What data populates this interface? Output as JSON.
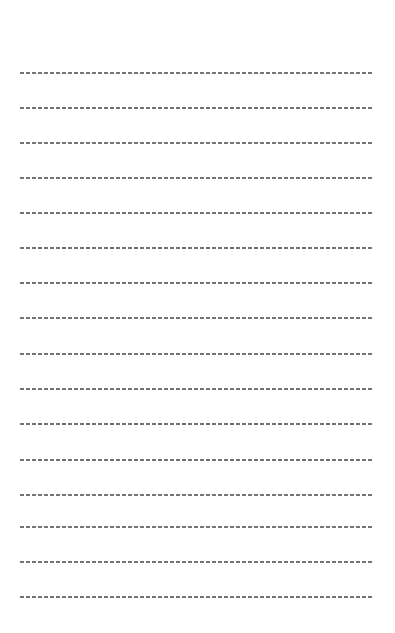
{
  "page": {
    "type": "blank-lined-sheet",
    "line_style": "dashed",
    "line_color": "#5a5a5a",
    "line_count": 16,
    "line_positions_y": [
      72,
      107,
      142,
      177,
      212,
      247,
      282,
      317,
      353,
      388,
      423,
      459,
      494,
      526,
      561,
      596
    ]
  }
}
